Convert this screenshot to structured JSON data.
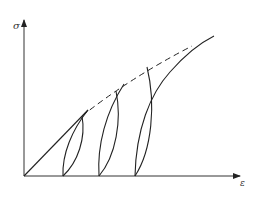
{
  "diagram": {
    "type": "stress-strain cyclic loading diagram",
    "y_axis_label": "σ",
    "x_axis_label": "ε",
    "colors": {
      "line": "#222222",
      "axis": "#333333",
      "background": "#ffffff"
    },
    "geometry": {
      "origin": [
        24,
        176
      ],
      "y_axis_top": [
        24,
        20
      ],
      "x_axis_right": [
        240,
        176
      ],
      "initial_loading_line": {
        "from": [
          24,
          176
        ],
        "to": [
          88,
          110
        ]
      },
      "loops": [
        {
          "peak": [
            82,
            116
          ],
          "foot": [
            63,
            176
          ]
        },
        {
          "peak": [
            116,
            91
          ],
          "foot": [
            99,
            176
          ]
        },
        {
          "peak": [
            147,
            67
          ],
          "foot": [
            135,
            176
          ]
        }
      ],
      "envelope_dashed": {
        "from": [
          82,
          116
        ],
        "to": [
          192,
          46
        ]
      },
      "monotonic_curve": {
        "from": [
          135,
          176
        ],
        "to": [
          214,
          36
        ]
      }
    }
  }
}
